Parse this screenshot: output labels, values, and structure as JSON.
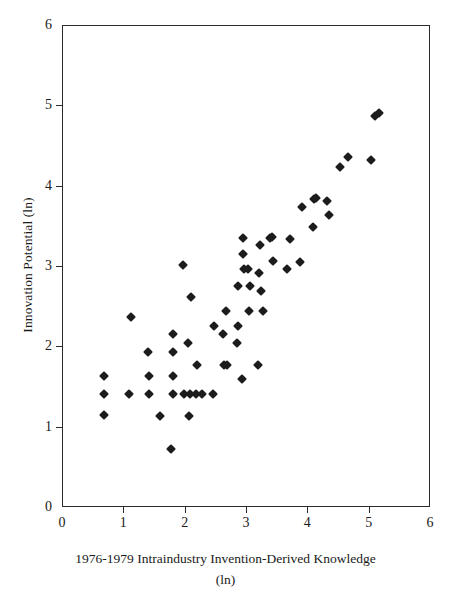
{
  "chart_data": {
    "type": "scatter",
    "title": "",
    "xlabel": "1976-1979 Intraindustry Invention-Derived Knowledge (ln)",
    "xlabel_line1": "1976-1979 Intraindustry Invention-Derived Knowledge",
    "xlabel_line2": "(ln)",
    "ylabel": "Innovation Potential (ln)",
    "xlim": [
      0,
      6
    ],
    "ylim": [
      0,
      6
    ],
    "xticks": [
      0,
      1,
      2,
      3,
      4,
      5,
      6
    ],
    "yticks": [
      0,
      1,
      2,
      3,
      4,
      5,
      6
    ],
    "xtick_labels": [
      "0",
      "1",
      "2",
      "3",
      "4",
      "5",
      "6"
    ],
    "ytick_labels": [
      "0",
      "1",
      "2",
      "3",
      "4",
      "5",
      "6"
    ],
    "grid": false,
    "legend": false,
    "marker": "diamond",
    "marker_color": "#1c1c1c",
    "frame_color": "#2b2b2b",
    "background_color": "#ffffff",
    "n_points": 84,
    "points": [
      [
        0.67,
        1.64
      ],
      [
        0.67,
        1.42
      ],
      [
        0.67,
        1.16
      ],
      [
        1.08,
        1.42
      ],
      [
        1.11,
        2.38
      ],
      [
        1.4,
        1.64
      ],
      [
        1.4,
        1.42
      ],
      [
        1.39,
        1.94
      ],
      [
        1.58,
        1.15
      ],
      [
        1.76,
        0.73
      ],
      [
        1.79,
        1.64
      ],
      [
        1.79,
        1.42
      ],
      [
        1.8,
        1.94
      ],
      [
        1.8,
        2.17
      ],
      [
        1.96,
        3.02
      ],
      [
        1.97,
        1.42
      ],
      [
        2.04,
        2.06
      ],
      [
        2.06,
        1.15
      ],
      [
        2.07,
        1.42
      ],
      [
        2.08,
        2.63
      ],
      [
        2.17,
        1.42
      ],
      [
        2.18,
        1.78
      ],
      [
        2.27,
        1.42
      ],
      [
        2.45,
        1.42
      ],
      [
        2.46,
        2.26
      ],
      [
        2.61,
        2.17
      ],
      [
        2.63,
        1.78
      ],
      [
        2.67,
        1.78
      ],
      [
        2.65,
        2.45
      ],
      [
        2.83,
        2.06
      ],
      [
        2.85,
        2.26
      ],
      [
        2.86,
        2.76
      ],
      [
        2.92,
        1.6
      ],
      [
        2.93,
        3.16
      ],
      [
        2.94,
        3.36
      ],
      [
        2.95,
        2.98
      ],
      [
        3.01,
        2.98
      ],
      [
        3.03,
        2.45
      ],
      [
        3.05,
        2.76
      ],
      [
        3.18,
        1.78
      ],
      [
        3.19,
        2.92
      ],
      [
        3.21,
        3.28
      ],
      [
        3.23,
        2.7
      ],
      [
        3.26,
        2.45
      ],
      [
        3.37,
        3.36
      ],
      [
        3.41,
        3.37
      ],
      [
        3.42,
        3.07
      ],
      [
        3.66,
        2.98
      ],
      [
        3.7,
        3.35
      ],
      [
        3.87,
        3.06
      ],
      [
        3.9,
        3.75
      ],
      [
        4.07,
        3.5
      ],
      [
        4.09,
        3.85
      ],
      [
        4.12,
        3.86
      ],
      [
        4.3,
        3.82
      ],
      [
        4.33,
        3.65
      ],
      [
        4.51,
        4.25
      ],
      [
        4.64,
        4.37
      ],
      [
        5.02,
        4.33
      ],
      [
        5.08,
        4.88
      ],
      [
        5.15,
        4.92
      ]
    ]
  }
}
